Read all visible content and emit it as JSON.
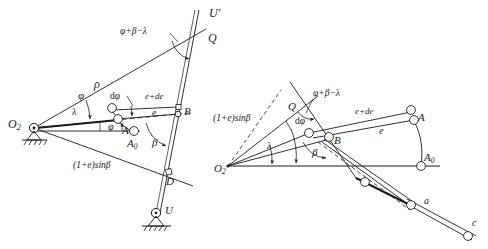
{
  "figure": {
    "type": "engineering-kinematic-diagram",
    "stroke_color": "#1b1b1b",
    "background_color": "#ffffff"
  },
  "left_diagram": {
    "name": "left-mechanism-diagram",
    "labels": {
      "pivot_o2": "O",
      "pivot_o2_sub": "2",
      "rho": "ρ",
      "phi_beta_lambda": "φ+β−λ",
      "u_prime": "U′",
      "point_q": "Q",
      "point_b": "B",
      "point_a": "A",
      "point_a0": "A",
      "point_a0_sub": "0",
      "point_d": "D",
      "point_u": "U",
      "e_plus_de": "e+de",
      "e": "e",
      "phi_upper": "φ",
      "phi_lower": "φ",
      "d_phi": "dφ",
      "lambda": "λ",
      "beta": "β",
      "one_plus_e_sin_beta": "(1+e)sinβ"
    }
  },
  "right_diagram": {
    "name": "right-mechanism-diagram",
    "labels": {
      "pivot_o2": "O",
      "pivot_o2_sub": "2",
      "phi_beta_lambda": "φ+β−λ",
      "point_q": "Q",
      "point_a": "A",
      "point_a0": "A",
      "point_a0_sub": "0",
      "point_b": "B",
      "e_plus_de": "e+de",
      "e": "e",
      "d_phi": "dφ",
      "lambda": "λ",
      "beta": "β",
      "one_plus_e_sin_beta": "(1+e)sinβ",
      "point_a_lower": "a",
      "point_c": "c"
    }
  }
}
